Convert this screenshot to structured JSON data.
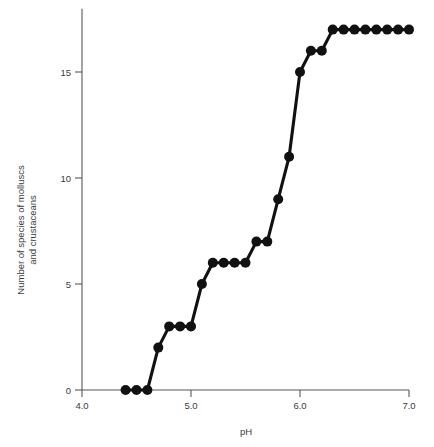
{
  "chart_data": {
    "type": "line",
    "title": "",
    "subtitle": "",
    "xlabel": "pH",
    "ylabel": "Number of species of molluscs\nand crustaceans",
    "ylabel_line1": "Number of species of molluscs",
    "ylabel_line2": "and crustaceans",
    "xlim": [
      4.0,
      7.0
    ],
    "ylim": [
      0,
      17.8
    ],
    "xticks": [
      4.0,
      5.0,
      6.0,
      7.0
    ],
    "xticklabels": [
      "4.0",
      "5.0",
      "6.0",
      "7.0"
    ],
    "yticks": [
      0,
      5,
      10,
      15
    ],
    "yticklabels": [
      "0",
      "5",
      "10",
      "15"
    ],
    "grid": false,
    "legend": null,
    "legend_position": "none",
    "marker": "filled-circle",
    "marker_size": 5,
    "line_color": "#111111",
    "axis_color": "#58585a",
    "background_color": "#ffffff",
    "x": [
      4.4,
      4.5,
      4.6,
      4.7,
      4.8,
      4.9,
      5.0,
      5.1,
      5.2,
      5.3,
      5.4,
      5.5,
      5.6,
      5.7,
      5.8,
      5.9,
      6.0,
      6.1,
      6.2,
      6.3,
      6.4,
      6.5,
      6.6,
      6.7,
      6.8,
      6.9,
      7.0
    ],
    "values": [
      0,
      0,
      0,
      2,
      3,
      3,
      3,
      5,
      6,
      6,
      6,
      6,
      7,
      7,
      9,
      11,
      15,
      16,
      16,
      17,
      17,
      17,
      17,
      17,
      17,
      17,
      17
    ],
    "series": [
      {
        "name": "Number of species of molluscs and crustaceans",
        "values": [
          0,
          0,
          0,
          2,
          3,
          3,
          3,
          5,
          6,
          6,
          6,
          6,
          7,
          7,
          9,
          11,
          15,
          16,
          16,
          17,
          17,
          17,
          17,
          17,
          17,
          17,
          17
        ]
      }
    ]
  }
}
